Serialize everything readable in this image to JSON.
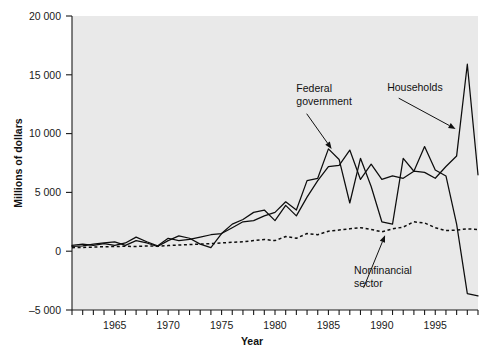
{
  "chart_data": {
    "type": "line",
    "title": "",
    "xlabel": "Year",
    "ylabel": "Millions of dollars",
    "xlim": [
      1961,
      1999
    ],
    "ylim": [
      -5000,
      20000
    ],
    "grid": false,
    "legend_position": "inline-annotations",
    "y_ticks": [
      -5000,
      0,
      5000,
      10000,
      15000,
      20000
    ],
    "y_tick_labels": [
      "–5 000",
      "0",
      "5 000",
      "10 000",
      "15 000",
      "20 000"
    ],
    "x_ticks": [
      1961,
      1962,
      1963,
      1964,
      1965,
      1966,
      1967,
      1968,
      1969,
      1970,
      1971,
      1972,
      1973,
      1974,
      1975,
      1976,
      1977,
      1978,
      1979,
      1980,
      1981,
      1982,
      1983,
      1984,
      1985,
      1986,
      1987,
      1988,
      1989,
      1990,
      1991,
      1992,
      1993,
      1994,
      1995,
      1996,
      1997,
      1998,
      1999
    ],
    "x_tick_labels": [
      "1965",
      "1970",
      "1975",
      "1980",
      "1985",
      "1990",
      "1995"
    ],
    "x_labeled_ticks": [
      1965,
      1970,
      1975,
      1980,
      1985,
      1990,
      1995
    ],
    "x": [
      1961,
      1962,
      1963,
      1964,
      1965,
      1966,
      1967,
      1968,
      1969,
      1970,
      1971,
      1972,
      1973,
      1974,
      1975,
      1976,
      1977,
      1978,
      1979,
      1980,
      1981,
      1982,
      1983,
      1984,
      1985,
      1986,
      1987,
      1988,
      1989,
      1990,
      1991,
      1992,
      1993,
      1994,
      1995,
      1996,
      1997,
      1998,
      1999
    ],
    "series": [
      {
        "name": "Households",
        "style": "solid",
        "color": "#0d0d0d",
        "values": [
          400,
          450,
          600,
          700,
          800,
          500,
          900,
          700,
          400,
          900,
          1300,
          1100,
          600,
          300,
          1500,
          2300,
          2700,
          3300,
          3500,
          2600,
          3900,
          3000,
          4600,
          6000,
          7200,
          7300,
          8600,
          6100,
          7400,
          6100,
          6400,
          6200,
          6800,
          6700,
          6200,
          7200,
          8100,
          15900,
          6500
        ]
      },
      {
        "name": "Federal government",
        "style": "solid",
        "color": "#0d0d0d",
        "values": [
          500,
          600,
          500,
          650,
          500,
          700,
          1200,
          800,
          450,
          1100,
          900,
          1000,
          1200,
          1400,
          1500,
          2000,
          2500,
          2600,
          3000,
          3300,
          4200,
          3500,
          6000,
          6200,
          8700,
          7800,
          4100,
          7900,
          5500,
          2500,
          2300,
          7900,
          6800,
          8900,
          6900,
          6400,
          2300,
          -3600,
          -3800
        ]
      },
      {
        "name": "Nonfinancial sector",
        "style": "dotted",
        "color": "#0d0d0d",
        "values": [
          300,
          320,
          350,
          380,
          400,
          420,
          400,
          450,
          420,
          480,
          520,
          560,
          600,
          640,
          700,
          760,
          800,
          900,
          1000,
          900,
          1250,
          1100,
          1500,
          1400,
          1700,
          1800,
          1900,
          2000,
          1850,
          1650,
          1900,
          2050,
          2500,
          2400,
          2000,
          1750,
          1800,
          1900,
          1850
        ]
      }
    ],
    "annotations": [
      {
        "id": "federal-government",
        "text_lines": [
          "Federal",
          "government"
        ],
        "text_x": 1982.0,
        "text_y": 13500,
        "arrow_to_x": 1985.3,
        "arrow_to_y": 8700
      },
      {
        "id": "households",
        "text_lines": [
          "Households"
        ],
        "text_x": 1990.5,
        "text_y": 13600,
        "arrow_to_x": 1996.9,
        "arrow_to_y": 10400
      },
      {
        "id": "nonfinancial-sector",
        "text_lines": [
          "Nonfinancial",
          "sector"
        ],
        "text_x": 1987.4,
        "text_y": -1900,
        "arrow_to_x": 1990.3,
        "arrow_to_y": 1350
      }
    ]
  },
  "style": {
    "plot_background": "#e9e9e9",
    "page_background": "#ffffff",
    "line_color": "#0d0d0d",
    "text_color": "#111111"
  }
}
